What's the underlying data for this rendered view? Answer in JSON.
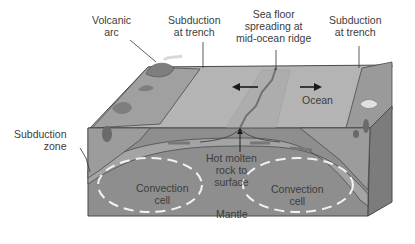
{
  "diagram": {
    "type": "plate-tectonics-cross-section",
    "colors": {
      "background": "#ffffff",
      "ocean_surface": "#b4b4b4",
      "continent": "#9a9a9a",
      "lithosphere": "#a8a8a8",
      "mantle": "#8e8e8e",
      "mantle_side": "#7c7c7c",
      "outline": "#4a4a4a",
      "arrow_white": "#f2f2f2",
      "arrow_black": "#1a1a1a",
      "text": "#3c3c3c"
    },
    "labels": {
      "volcanic_arc": [
        "Volcanic",
        "arc"
      ],
      "subduction_left": [
        "Subduction",
        "at trench"
      ],
      "sea_floor": [
        "Sea floor",
        "spreading at",
        "mid-ocean ridge"
      ],
      "subduction_right": [
        "Subduction",
        "at trench"
      ],
      "ocean": "Ocean",
      "subduction_zone": [
        "Subduction",
        "zone"
      ],
      "hot_molten": [
        "Hot molten",
        "rock to",
        "surface"
      ],
      "convection_left": [
        "Convection",
        "cell"
      ],
      "convection_right": [
        "Convection",
        "cell"
      ],
      "mantle": "Mantle"
    }
  }
}
